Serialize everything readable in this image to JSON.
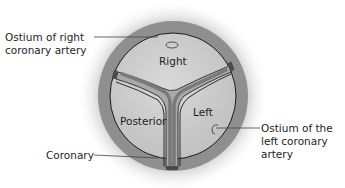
{
  "diagram": {
    "cusps": {
      "right": "Right",
      "posterior": "Posterior",
      "left": "Left"
    },
    "callouts": {
      "ostium_right_line1": "Ostium of right",
      "ostium_right_line2": "coronary artery",
      "ostium_left_line1": "Ostium of the",
      "ostium_left_line2": "left coronary",
      "ostium_left_line3": "artery",
      "coronary": "Coronary"
    },
    "colors": {
      "ring": "#8f8f8f",
      "cusp_fill": "#c9c9c9",
      "commissure": "#8a8a8a",
      "outline": "#1a1a1a",
      "halo": "#e6e6e6"
    }
  }
}
